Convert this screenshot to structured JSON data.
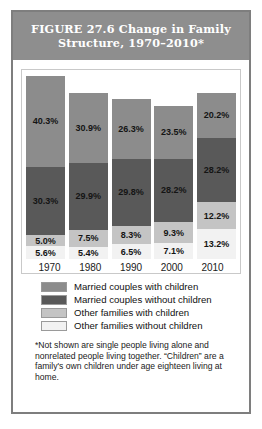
{
  "figure": {
    "title": "FIGURE 27.6   Change in Family Structure, 1970–2010*",
    "footnote": "*Not shown are single people living alone and nonrelated people living together. “Children” are a family's own children under age eighteen living at home."
  },
  "legend": {
    "items": [
      {
        "label": "Married couples with children",
        "color": "#8c8c8c"
      },
      {
        "label": "Married couples without children",
        "color": "#595959"
      },
      {
        "label": "Other families with children",
        "color": "#c4c4c4"
      },
      {
        "label": "Other families without children",
        "color": "#f2f2f2"
      }
    ]
  },
  "chart_data": {
    "type": "bar",
    "title": "FIGURE 27.6   Change in Family Structure, 1970–2010*",
    "xlabel": "",
    "ylabel": "",
    "stacked": true,
    "grid": false,
    "legend_position": "below-plot",
    "ylim": [
      0,
      81.2
    ],
    "categories": [
      "1970",
      "1980",
      "1990",
      "2000",
      "2010"
    ],
    "series": [
      {
        "name": "Married couples with children",
        "color": "#8c8c8c",
        "values": [
          40.3,
          30.9,
          26.3,
          23.5,
          20.2
        ]
      },
      {
        "name": "Married couples without children",
        "color": "#595959",
        "values": [
          30.3,
          29.9,
          29.8,
          28.2,
          28.2
        ]
      },
      {
        "name": "Other families with children",
        "color": "#c4c4c4",
        "values": [
          5.0,
          7.5,
          8.3,
          9.3,
          12.2
        ]
      },
      {
        "name": "Other families without children",
        "color": "#f2f2f2",
        "values": [
          5.6,
          5.4,
          6.5,
          7.1,
          13.2
        ]
      }
    ],
    "bars": [
      {
        "category": "1970",
        "total": 81.2,
        "segments": [
          {
            "series": "Married couples with children",
            "value": 40.3,
            "label": "40.3%",
            "color": "#8c8c8c"
          },
          {
            "series": "Married couples without children",
            "value": 30.3,
            "label": "30.3%",
            "color": "#595959"
          },
          {
            "series": "Other families with children",
            "value": 5.0,
            "label": "5.0%",
            "color": "#c4c4c4"
          },
          {
            "series": "Other families without children",
            "value": 5.6,
            "label": "5.6%",
            "color": "#f2f2f2"
          }
        ]
      },
      {
        "category": "1980",
        "total": 73.7,
        "segments": [
          {
            "series": "Married couples with children",
            "value": 30.9,
            "label": "30.9%",
            "color": "#8c8c8c"
          },
          {
            "series": "Married couples without children",
            "value": 29.9,
            "label": "29.9%",
            "color": "#595959"
          },
          {
            "series": "Other families with children",
            "value": 7.5,
            "label": "7.5%",
            "color": "#c4c4c4"
          },
          {
            "series": "Other families without children",
            "value": 5.4,
            "label": "5.4%",
            "color": "#f2f2f2"
          }
        ]
      },
      {
        "category": "1990",
        "total": 70.9,
        "segments": [
          {
            "series": "Married couples with children",
            "value": 26.3,
            "label": "26.3%",
            "color": "#8c8c8c"
          },
          {
            "series": "Married couples without children",
            "value": 29.8,
            "label": "29.8%",
            "color": "#595959"
          },
          {
            "series": "Other families with children",
            "value": 8.3,
            "label": "8.3%",
            "color": "#c4c4c4"
          },
          {
            "series": "Other families without children",
            "value": 6.5,
            "label": "6.5%",
            "color": "#f2f2f2"
          }
        ]
      },
      {
        "category": "2000",
        "total": 68.1,
        "segments": [
          {
            "series": "Married couples with children",
            "value": 23.5,
            "label": "23.5%",
            "color": "#8c8c8c"
          },
          {
            "series": "Married couples without children",
            "value": 28.2,
            "label": "28.2%",
            "color": "#595959"
          },
          {
            "series": "Other families with children",
            "value": 9.3,
            "label": "9.3%",
            "color": "#c4c4c4"
          },
          {
            "series": "Other families without children",
            "value": 7.1,
            "label": "7.1%",
            "color": "#f2f2f2"
          }
        ]
      },
      {
        "category": "2010",
        "total": 73.8,
        "segments": [
          {
            "series": "Married couples with children",
            "value": 20.2,
            "label": "20.2%",
            "color": "#8c8c8c"
          },
          {
            "series": "Married couples without children",
            "value": 28.2,
            "label": "28.2%",
            "color": "#595959"
          },
          {
            "series": "Other families with children",
            "value": 12.2,
            "label": "12.2%",
            "color": "#c4c4c4"
          },
          {
            "series": "Other families without children",
            "value": 13.2,
            "label": "13.2%",
            "color": "#f2f2f2"
          }
        ]
      }
    ]
  }
}
